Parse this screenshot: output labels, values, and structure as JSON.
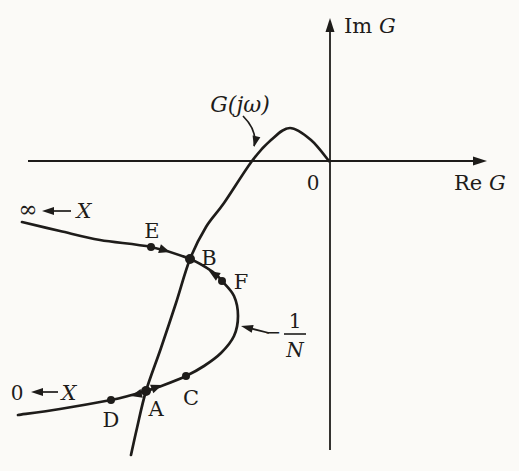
{
  "figure": {
    "colors": {
      "background": "#fbfaf7",
      "ink": "#1e1c1a"
    },
    "canvas": {
      "width": 519,
      "height": 471
    },
    "axes": [
      {
        "id": "re-axis",
        "from": [
          28,
          161
        ],
        "to": [
          487,
          161
        ]
      },
      {
        "id": "im-axis",
        "from": [
          330,
          450
        ],
        "to": [
          330,
          18
        ]
      }
    ],
    "curves": [
      {
        "id": "g-curve",
        "label": "G(jω)",
        "points": [
          [
            131,
            455
          ],
          [
            137,
            428
          ],
          [
            146,
            391
          ],
          [
            161,
            348
          ],
          [
            176,
            303
          ],
          [
            190,
            259
          ],
          [
            206,
            227
          ],
          [
            224,
            203
          ],
          [
            252,
            161
          ],
          [
            271,
            140
          ],
          [
            290,
            128
          ],
          [
            311,
            140
          ],
          [
            329,
            161
          ]
        ]
      },
      {
        "id": "n-curve",
        "label": "-1/N",
        "points": [
          [
            22,
            222
          ],
          [
            60,
            231
          ],
          [
            100,
            240
          ],
          [
            151,
            247
          ],
          [
            190,
            259
          ],
          [
            213,
            272
          ],
          [
            222,
            281
          ],
          [
            234,
            296
          ],
          [
            238,
            316
          ],
          [
            234,
            336
          ],
          [
            221,
            353
          ],
          [
            204,
            366
          ],
          [
            186,
            376
          ],
          [
            164,
            385
          ],
          [
            146,
            391
          ],
          [
            128,
            396
          ],
          [
            111,
            400
          ],
          [
            60,
            409
          ],
          [
            18,
            415
          ]
        ]
      }
    ],
    "dots": [
      {
        "id": "point-E",
        "label": "E",
        "pos": [
          151,
          247
        ],
        "r": 4
      },
      {
        "id": "point-B",
        "label": "B",
        "pos": [
          190,
          259
        ],
        "r": 5
      },
      {
        "id": "point-F",
        "label": "F",
        "pos": [
          222,
          281
        ],
        "r": 4
      },
      {
        "id": "point-C",
        "label": "C",
        "pos": [
          186,
          376
        ],
        "r": 4
      },
      {
        "id": "point-A",
        "label": "A",
        "pos": [
          146,
          391
        ],
        "r": 5
      },
      {
        "id": "point-D",
        "label": "D",
        "pos": [
          111,
          400
        ],
        "r": 4
      }
    ],
    "direction_arrowheads": [
      {
        "id": "arrow-e-to-b",
        "pos": [
          170,
          252
        ],
        "angle": 18
      },
      {
        "id": "arrow-f-to-b",
        "pos": [
          209,
          271
        ],
        "angle": 212
      },
      {
        "id": "arrow-a-to-d",
        "pos": [
          131,
          396
        ],
        "angle": 166
      },
      {
        "id": "arrow-a-to-c",
        "pos": [
          162,
          385
        ],
        "angle": -21
      }
    ],
    "straight_arrows": [
      {
        "id": "inf-x-arrow",
        "from": [
          71,
          211
        ],
        "to": [
          42,
          211
        ]
      },
      {
        "id": "zero-x-arrow",
        "from": [
          58,
          392
        ],
        "to": [
          31,
          392
        ]
      },
      {
        "id": "n-label-arrow",
        "from": [
          269,
          333
        ],
        "to": [
          241,
          326
        ]
      }
    ],
    "curved_arrows": [
      {
        "id": "g-label-arrow",
        "path": "M243,116 C250,123 257,134 254,146",
        "tip": [
          254,
          147
        ],
        "tip_angle": 103
      }
    ],
    "labels": [
      {
        "id": "im-axis-label",
        "pos": [
          344,
          33
        ],
        "anchor": "start",
        "size": 21,
        "runs": [
          {
            "t": "Im ",
            "i": false
          },
          {
            "t": "G",
            "i": true
          }
        ]
      },
      {
        "id": "re-axis-label",
        "pos": [
          454,
          190
        ],
        "anchor": "start",
        "size": 21,
        "runs": [
          {
            "t": "Re ",
            "i": false
          },
          {
            "t": "G",
            "i": true
          }
        ]
      },
      {
        "id": "origin-label",
        "pos": [
          313,
          190
        ],
        "anchor": "middle",
        "size": 20,
        "runs": [
          {
            "t": "0",
            "i": false
          }
        ]
      },
      {
        "id": "g-curve-label",
        "pos": [
          240,
          112
        ],
        "anchor": "middle",
        "size": 22,
        "runs": [
          {
            "t": "G(jω)",
            "i": true
          }
        ]
      },
      {
        "id": "inf-label",
        "pos": [
          28,
          217
        ],
        "anchor": "middle",
        "size": 23,
        "runs": [
          {
            "t": "∞",
            "i": false
          }
        ]
      },
      {
        "id": "x-top-label",
        "pos": [
          84,
          218
        ],
        "anchor": "middle",
        "size": 21,
        "runs": [
          {
            "t": "X",
            "i": true
          }
        ]
      },
      {
        "id": "zero-left-label",
        "pos": [
          17,
          400
        ],
        "anchor": "middle",
        "size": 20,
        "runs": [
          {
            "t": "0",
            "i": false
          }
        ]
      },
      {
        "id": "x-bottom-label",
        "pos": [
          69,
          400
        ],
        "anchor": "middle",
        "size": 21,
        "runs": [
          {
            "t": "X",
            "i": true
          }
        ]
      },
      {
        "id": "label-E",
        "pos": [
          152,
          238
        ],
        "anchor": "middle",
        "size": 21,
        "runs": [
          {
            "t": "E",
            "i": false
          }
        ]
      },
      {
        "id": "label-B",
        "pos": [
          209,
          265
        ],
        "anchor": "middle",
        "size": 21,
        "runs": [
          {
            "t": "B",
            "i": false
          }
        ]
      },
      {
        "id": "label-F",
        "pos": [
          241,
          289
        ],
        "anchor": "middle",
        "size": 21,
        "runs": [
          {
            "t": "F",
            "i": false
          }
        ]
      },
      {
        "id": "label-C",
        "pos": [
          191,
          405
        ],
        "anchor": "middle",
        "size": 21,
        "runs": [
          {
            "t": "C",
            "i": false
          }
        ]
      },
      {
        "id": "label-A",
        "pos": [
          156,
          416
        ],
        "anchor": "middle",
        "size": 21,
        "runs": [
          {
            "t": "A",
            "i": false
          }
        ]
      },
      {
        "id": "label-D",
        "pos": [
          111,
          427
        ],
        "anchor": "middle",
        "size": 21,
        "runs": [
          {
            "t": "D",
            "i": false
          }
        ]
      }
    ],
    "fraction_label": {
      "id": "n-curve-label",
      "minus": "−",
      "minus_pos": [
        273,
        339
      ],
      "num": "1",
      "num_pos": [
        295,
        328
      ],
      "bar": [
        [
          284,
          334
        ],
        [
          306,
          334
        ]
      ],
      "den": "N",
      "den_pos": [
        295,
        357
      ],
      "size": 20
    }
  }
}
